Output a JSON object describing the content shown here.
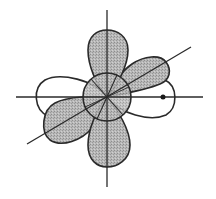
{
  "diagram": {
    "title": "",
    "center": {
      "x": 107,
      "y": 97
    },
    "colors": {
      "stroke": "#2a2a2a",
      "shade": "#b4b4b4",
      "unshaded": "#ffffff",
      "background": "#ffffff"
    },
    "axes": [
      {
        "name": "horizontal-axis",
        "x1": 16,
        "y1": 97,
        "x2": 203,
        "y2": 97
      },
      {
        "name": "vertical-axis",
        "x1": 107,
        "y1": 10,
        "x2": 107,
        "y2": 187
      },
      {
        "name": "diagonal-axis",
        "x1": 27,
        "y1": 144,
        "x2": 191,
        "y2": 47
      }
    ],
    "lobes": [
      {
        "name": "top-shaded-lobe",
        "shaded": true
      },
      {
        "name": "bottom-shaded-lobe",
        "shaded": true
      },
      {
        "name": "upper-right-diagonal-shaded-lobe",
        "shaded": true
      },
      {
        "name": "lower-left-diagonal-shaded-lobe",
        "shaded": true
      },
      {
        "name": "right-unshaded-lobe",
        "shaded": false
      },
      {
        "name": "left-unshaded-lobe",
        "shaded": false
      }
    ],
    "central_sphere": {
      "radius": 24,
      "shaded": true
    },
    "marker_point": {
      "x": 163,
      "y": 97,
      "radius": 2.5
    }
  }
}
